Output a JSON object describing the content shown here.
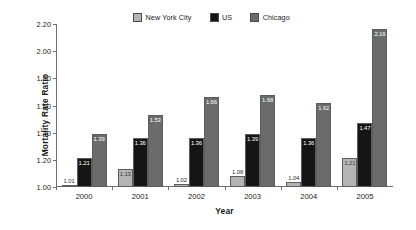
{
  "chart_data": {
    "type": "bar",
    "title": "",
    "xlabel": "Year",
    "ylabel": "Mortality Rate Ratio",
    "categories": [
      "2000",
      "2001",
      "2002",
      "2003",
      "2004",
      "2005"
    ],
    "ylim": [
      1.0,
      2.2
    ],
    "ytick_step": 0.2,
    "ytick_labels": [
      "1.00",
      "1.20",
      "1.40",
      "1.60",
      "1.80",
      "2.00",
      "2.20"
    ],
    "grid": false,
    "legend_position": "top-center",
    "series": [
      {
        "name": "New York City",
        "color": "#b4b4b4",
        "values": [
          1.01,
          1.13,
          1.02,
          1.08,
          1.04,
          1.21
        ],
        "labels": [
          "1.01",
          "1.13",
          "1.02",
          "1.08",
          "1.04",
          "1.21"
        ]
      },
      {
        "name": "US",
        "color": "#151515",
        "values": [
          1.21,
          1.36,
          1.36,
          1.39,
          1.36,
          1.47
        ],
        "labels": [
          "1.21",
          "1.36",
          "1.36",
          "1.39",
          "1.36",
          "1.47"
        ]
      },
      {
        "name": "Chicago",
        "color": "#6b6b6b",
        "values": [
          1.39,
          1.53,
          1.66,
          1.68,
          1.62,
          2.16
        ],
        "labels": [
          "1.39",
          "1.53",
          "1.66",
          "1.68",
          "1.62",
          "2.16"
        ]
      }
    ]
  }
}
